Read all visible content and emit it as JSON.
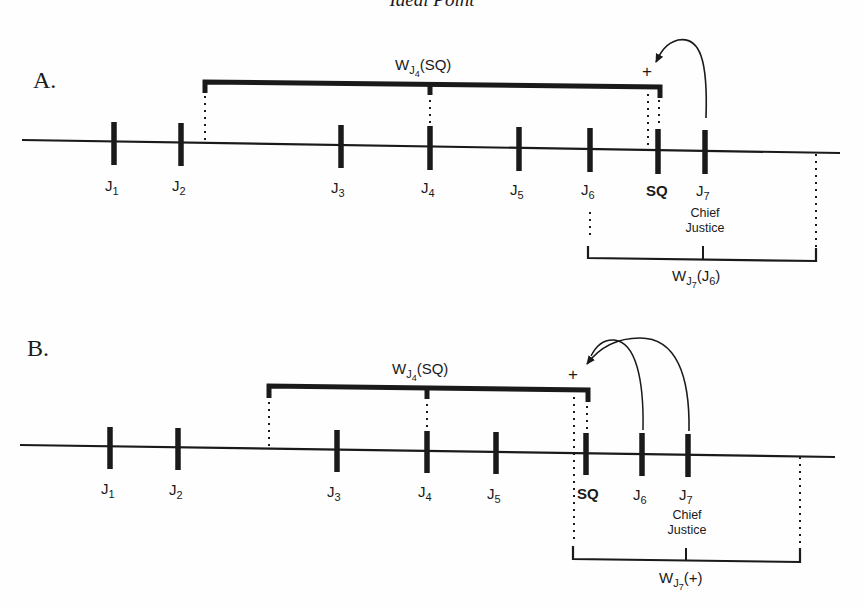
{
  "title": "Ideal Point",
  "colors": {
    "ink": "#1a1a1a",
    "background": "#fefefe"
  },
  "panels": [
    {
      "id": "A",
      "letter": "A.",
      "justices": [
        {
          "label": "J",
          "sub": "1",
          "x": 114
        },
        {
          "label": "J",
          "sub": "2",
          "x": 181
        },
        {
          "label": "J",
          "sub": "3",
          "x": 341
        },
        {
          "label": "J",
          "sub": "4",
          "x": 430
        },
        {
          "label": "J",
          "sub": "5",
          "x": 519
        },
        {
          "label": "J",
          "sub": "6",
          "x": 590
        },
        {
          "label": "J",
          "sub": "7",
          "x": 705
        }
      ],
      "status_quo": {
        "label": "SQ",
        "x": 658
      },
      "chief_justice": {
        "line1": "Chief",
        "line2": "Justice"
      },
      "proposal_marker": "+",
      "win_set_top": {
        "w": "W",
        "sub_j": "J",
        "sub_n": "4",
        "arg": "(SQ)"
      },
      "win_set_bottom": {
        "w": "W",
        "sub_j": "J",
        "sub_n": "7",
        "arg_pre": "(J",
        "arg_sub": "6",
        "arg_post": ")"
      }
    },
    {
      "id": "B",
      "letter": "B.",
      "justices": [
        {
          "label": "J",
          "sub": "1",
          "x": 110
        },
        {
          "label": "J",
          "sub": "2",
          "x": 178
        },
        {
          "label": "J",
          "sub": "3",
          "x": 337
        },
        {
          "label": "J",
          "sub": "4",
          "x": 427
        },
        {
          "label": "J",
          "sub": "5",
          "x": 496
        },
        {
          "label": "J",
          "sub": "6",
          "x": 642
        },
        {
          "label": "J",
          "sub": "7",
          "x": 688
        }
      ],
      "status_quo": {
        "label": "SQ",
        "x": 586
      },
      "chief_justice": {
        "line1": "Chief",
        "line2": "Justice"
      },
      "proposal_marker": "+",
      "win_set_top": {
        "w": "W",
        "sub_j": "J",
        "sub_n": "4",
        "arg": "(SQ)"
      },
      "win_set_bottom": {
        "w": "W",
        "sub_j": "J",
        "sub_n": "7",
        "arg": "(+)"
      }
    }
  ]
}
